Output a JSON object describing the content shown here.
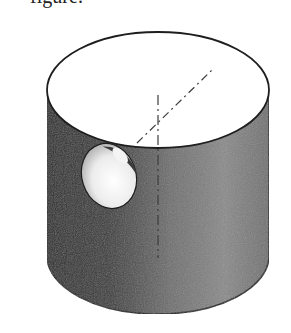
{
  "figure": {
    "caption_fragment": "figure:",
    "colors": {
      "background": "#ffffff",
      "top_face": "#ffffff",
      "outline": "#1e1e1e",
      "body_dark": "#2a2a2a",
      "body_mid": "#6e6e6e",
      "body_light": "#9a9a9a",
      "hole_inner_light": "#f2f2f2",
      "hole_inner_dark": "#3a3a3a",
      "centerline": "#3c3c3c"
    },
    "geometry": {
      "top_ellipse": {
        "cx": 158,
        "cy": 90,
        "rx": 111,
        "ry": 58
      },
      "body": {
        "left_x": 47,
        "right_x": 270,
        "bottom_cy": 256,
        "bottom_ry": 58
      },
      "hole": {
        "cx": 109,
        "cy": 176,
        "rx": 27,
        "ry": 33,
        "rotate": -18
      },
      "vertical_centerline": {
        "x": 158,
        "y1": 95,
        "y2": 258
      },
      "diagonal_centerline": {
        "x1": 137,
        "y1": 143,
        "x2": 212,
        "y2": 70
      }
    }
  }
}
